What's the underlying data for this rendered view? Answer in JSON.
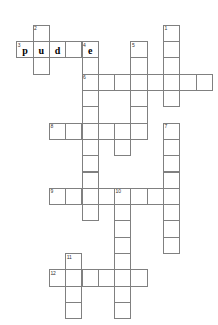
{
  "puzzle": {
    "title": "Crossword Puzzle Grid",
    "cell_size": 16.3,
    "origin_x": 16.3,
    "origin_y": 24.8,
    "grid_color": "#808080",
    "cell_fill": "#ffffff",
    "letter_color": "#000000",
    "number_color": "#333333",
    "background": "#ffffff",
    "cols": 12,
    "rows": 18
  },
  "entries": [
    {
      "number": "1",
      "direction": "down",
      "row": 0,
      "col": 9,
      "length": 5
    },
    {
      "number": "2",
      "direction": "down",
      "row": 0,
      "col": 1,
      "length": 3
    },
    {
      "number": "3",
      "direction": "across",
      "row": 1,
      "col": 0,
      "length": 5
    },
    {
      "number": "4",
      "direction": "down",
      "row": 1,
      "col": 4,
      "length": 12
    },
    {
      "number": "5",
      "direction": "down",
      "row": 1,
      "col": 7,
      "length": 6
    },
    {
      "number": "6",
      "direction": "across",
      "row": 3,
      "col": 4,
      "length": 9
    },
    {
      "number": "7",
      "direction": "down",
      "row": 6,
      "col": 9,
      "length": 8
    },
    {
      "number": "8",
      "direction": "across",
      "row": 6,
      "col": 2,
      "length": 6
    },
    {
      "number": "9",
      "direction": "across",
      "row": 10,
      "col": 2,
      "length": 8
    },
    {
      "number": "10",
      "direction": "down",
      "row": 10,
      "col": 6,
      "length": 8
    },
    {
      "number": "11",
      "direction": "down",
      "row": 14,
      "col": 3,
      "length": 4
    },
    {
      "number": "12",
      "direction": "across",
      "row": 15,
      "col": 2,
      "length": 6
    }
  ],
  "cells": [
    {
      "row": 0,
      "col": 1,
      "number": "2",
      "letter": ""
    },
    {
      "row": 0,
      "col": 9,
      "number": "1",
      "letter": ""
    },
    {
      "row": 1,
      "col": 0,
      "number": "3",
      "letter": "p"
    },
    {
      "row": 1,
      "col": 1,
      "number": "",
      "letter": "u"
    },
    {
      "row": 1,
      "col": 2,
      "number": "",
      "letter": "d"
    },
    {
      "row": 1,
      "col": 3,
      "number": "",
      "letter": ""
    },
    {
      "row": 1,
      "col": 4,
      "number": "4",
      "letter": "e"
    },
    {
      "row": 1,
      "col": 7,
      "number": "5",
      "letter": ""
    },
    {
      "row": 1,
      "col": 9,
      "number": "",
      "letter": ""
    },
    {
      "row": 2,
      "col": 1,
      "number": "",
      "letter": ""
    },
    {
      "row": 2,
      "col": 4,
      "number": "",
      "letter": ""
    },
    {
      "row": 2,
      "col": 7,
      "number": "",
      "letter": ""
    },
    {
      "row": 2,
      "col": 9,
      "number": "",
      "letter": ""
    },
    {
      "row": 3,
      "col": 4,
      "number": "6",
      "letter": ""
    },
    {
      "row": 3,
      "col": 5,
      "number": "",
      "letter": ""
    },
    {
      "row": 3,
      "col": 6,
      "number": "",
      "letter": ""
    },
    {
      "row": 3,
      "col": 7,
      "number": "",
      "letter": ""
    },
    {
      "row": 3,
      "col": 8,
      "number": "",
      "letter": ""
    },
    {
      "row": 3,
      "col": 9,
      "number": "",
      "letter": ""
    },
    {
      "row": 3,
      "col": 10,
      "number": "",
      "letter": ""
    },
    {
      "row": 3,
      "col": 11,
      "number": "",
      "letter": ""
    },
    {
      "row": 4,
      "col": 4,
      "number": "",
      "letter": ""
    },
    {
      "row": 4,
      "col": 7,
      "number": "",
      "letter": ""
    },
    {
      "row": 4,
      "col": 9,
      "number": "",
      "letter": ""
    },
    {
      "row": 5,
      "col": 4,
      "number": "",
      "letter": ""
    },
    {
      "row": 5,
      "col": 7,
      "number": "",
      "letter": ""
    },
    {
      "row": 6,
      "col": 2,
      "number": "8",
      "letter": ""
    },
    {
      "row": 6,
      "col": 3,
      "number": "",
      "letter": ""
    },
    {
      "row": 6,
      "col": 4,
      "number": "",
      "letter": ""
    },
    {
      "row": 6,
      "col": 5,
      "number": "",
      "letter": ""
    },
    {
      "row": 6,
      "col": 6,
      "number": "",
      "letter": ""
    },
    {
      "row": 6,
      "col": 7,
      "number": "",
      "letter": ""
    },
    {
      "row": 6,
      "col": 9,
      "number": "7",
      "letter": ""
    },
    {
      "row": 7,
      "col": 4,
      "number": "",
      "letter": ""
    },
    {
      "row": 7,
      "col": 6,
      "number": "",
      "letter": ""
    },
    {
      "row": 7,
      "col": 9,
      "number": "",
      "letter": ""
    },
    {
      "row": 8,
      "col": 4,
      "number": "",
      "letter": ""
    },
    {
      "row": 8,
      "col": 9,
      "number": "",
      "letter": ""
    },
    {
      "row": 9,
      "col": 4,
      "number": "",
      "letter": ""
    },
    {
      "row": 9,
      "col": 9,
      "number": "",
      "letter": ""
    },
    {
      "row": 10,
      "col": 2,
      "number": "9",
      "letter": ""
    },
    {
      "row": 10,
      "col": 3,
      "number": "",
      "letter": ""
    },
    {
      "row": 10,
      "col": 4,
      "number": "",
      "letter": ""
    },
    {
      "row": 10,
      "col": 5,
      "number": "",
      "letter": ""
    },
    {
      "row": 10,
      "col": 6,
      "number": "10",
      "letter": ""
    },
    {
      "row": 10,
      "col": 7,
      "number": "",
      "letter": ""
    },
    {
      "row": 10,
      "col": 8,
      "number": "",
      "letter": ""
    },
    {
      "row": 10,
      "col": 9,
      "number": "",
      "letter": ""
    },
    {
      "row": 11,
      "col": 4,
      "number": "",
      "letter": ""
    },
    {
      "row": 11,
      "col": 6,
      "number": "",
      "letter": ""
    },
    {
      "row": 11,
      "col": 9,
      "number": "",
      "letter": ""
    },
    {
      "row": 12,
      "col": 6,
      "number": "",
      "letter": ""
    },
    {
      "row": 12,
      "col": 9,
      "number": "",
      "letter": ""
    },
    {
      "row": 13,
      "col": 6,
      "number": "",
      "letter": ""
    },
    {
      "row": 13,
      "col": 9,
      "number": "",
      "letter": ""
    },
    {
      "row": 14,
      "col": 3,
      "number": "11",
      "letter": ""
    },
    {
      "row": 14,
      "col": 6,
      "number": "",
      "letter": ""
    },
    {
      "row": 15,
      "col": 2,
      "number": "12",
      "letter": ""
    },
    {
      "row": 15,
      "col": 3,
      "number": "",
      "letter": ""
    },
    {
      "row": 15,
      "col": 4,
      "number": "",
      "letter": ""
    },
    {
      "row": 15,
      "col": 5,
      "number": "",
      "letter": ""
    },
    {
      "row": 15,
      "col": 6,
      "number": "",
      "letter": ""
    },
    {
      "row": 15,
      "col": 7,
      "number": "",
      "letter": ""
    },
    {
      "row": 16,
      "col": 3,
      "number": "",
      "letter": ""
    },
    {
      "row": 16,
      "col": 6,
      "number": "",
      "letter": ""
    },
    {
      "row": 17,
      "col": 3,
      "number": "",
      "letter": ""
    },
    {
      "row": 17,
      "col": 6,
      "number": "",
      "letter": ""
    }
  ]
}
